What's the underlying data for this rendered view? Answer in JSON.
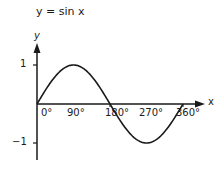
{
  "chart_data": {
    "type": "line",
    "title": "y = sin x",
    "xlabel": "x",
    "ylabel": "y",
    "x": [
      0,
      30,
      60,
      90,
      120,
      150,
      180,
      210,
      240,
      270,
      300,
      330,
      360
    ],
    "series": [
      {
        "name": "sin x",
        "values": [
          0,
          0.5,
          0.866,
          1,
          0.866,
          0.5,
          0,
          -0.5,
          -0.866,
          -1,
          -0.866,
          -0.5,
          0
        ]
      }
    ],
    "x_tick_labels": [
      "0°",
      "90°",
      "180°",
      "270°",
      "360°"
    ],
    "y_tick_labels": [
      "1",
      "−1"
    ],
    "xlim": [
      0,
      360
    ],
    "ylim": [
      -1,
      1
    ],
    "grid": false,
    "legend": null
  }
}
